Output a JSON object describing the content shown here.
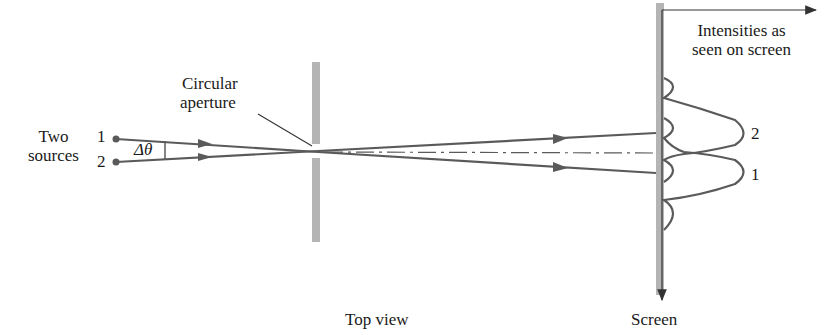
{
  "labels": {
    "two_sources_line1": "Two",
    "two_sources_line2": "sources",
    "source1": "1",
    "source2": "2",
    "delta_theta": "Δθ",
    "aperture_line1": "Circular",
    "aperture_line2": "aperture",
    "intensities_line1": "Intensities as",
    "intensities_line2": "seen on screen",
    "peak2": "2",
    "peak1": "1",
    "top_view": "Top view",
    "screen": "Screen"
  },
  "colors": {
    "ray": "#5a5a5a",
    "barrier": "#b4b4b4",
    "text": "#1a1a1a"
  }
}
